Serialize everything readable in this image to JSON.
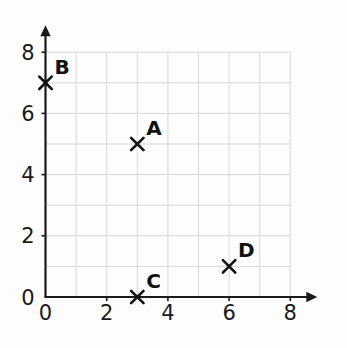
{
  "chart_data": {
    "type": "scatter",
    "title": "",
    "xlabel": "",
    "ylabel": "",
    "xlim": [
      0,
      8
    ],
    "ylim": [
      0,
      8
    ],
    "grid": true,
    "legend": "none",
    "x_ticks": [
      "0",
      "2",
      "4",
      "6",
      "8"
    ],
    "y_ticks": [
      "0",
      "2",
      "4",
      "6",
      "8"
    ],
    "x_tick_values": [
      0,
      2,
      4,
      6,
      8
    ],
    "y_tick_values": [
      0,
      2,
      4,
      6,
      8
    ],
    "marker": "x",
    "points": [
      {
        "label": "A",
        "x": 3,
        "y": 5
      },
      {
        "label": "B",
        "x": 0,
        "y": 7
      },
      {
        "label": "C",
        "x": 3,
        "y": 0
      },
      {
        "label": "D",
        "x": 6,
        "y": 1
      }
    ],
    "colors": {
      "axis": "#1a1a1a",
      "grid": "#d8d8d8",
      "marker": "#111111",
      "label": "#111111",
      "background": "#fdfdfd"
    }
  }
}
